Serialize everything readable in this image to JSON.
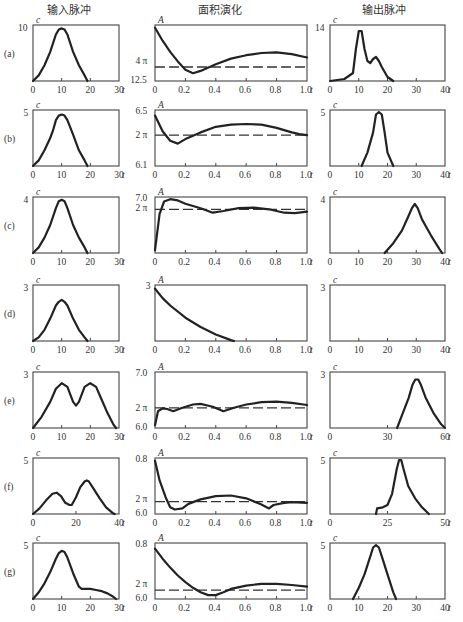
{
  "headers": {
    "input": "输入脉冲",
    "area": "面积演化",
    "output": "输出脉冲"
  },
  "caption": "图 — 对应(a)—(g)的输入脉冲波形、面积演化、输出脉冲波形（示意）",
  "chart_data": [
    {
      "row": "(a)",
      "type": "line",
      "panel": "input",
      "ylabel": "c",
      "xlabel": "t",
      "xlim": [
        0,
        30
      ],
      "ylim": [
        0,
        10
      ],
      "yticks": [
        "10"
      ],
      "xticks": [
        "0",
        "10",
        "20",
        "30"
      ],
      "x": [
        0,
        2,
        4,
        6,
        8,
        9,
        10,
        11,
        12,
        14,
        16,
        18,
        19
      ],
      "y": [
        0,
        1,
        2.8,
        5.2,
        8.3,
        9.2,
        9.4,
        9.2,
        8.3,
        5.2,
        2.8,
        1,
        0
      ]
    },
    {
      "row": "(a)",
      "type": "line",
      "panel": "area",
      "ylabel": "A",
      "xlabel": "t",
      "xlim": [
        0,
        1.0
      ],
      "ylim": [
        12.5,
        "top"
      ],
      "yticks": [
        "4 π",
        "12.5"
      ],
      "xticks": [
        "0",
        "0.2",
        "0.4",
        "0.6",
        "0.8",
        "1.0"
      ],
      "x": [
        0,
        0.05,
        0.1,
        0.15,
        0.2,
        0.25,
        0.3,
        0.4,
        0.5,
        0.6,
        0.7,
        0.8,
        0.9,
        1.0
      ],
      "y": [
        0.95,
        0.72,
        0.52,
        0.35,
        0.2,
        0.14,
        0.18,
        0.3,
        0.4,
        0.46,
        0.5,
        0.51,
        0.48,
        0.42
      ],
      "reference": "4π dashed"
    },
    {
      "row": "(a)",
      "type": "line",
      "panel": "output",
      "ylabel": "c",
      "xlabel": "t",
      "xlim": [
        0,
        40
      ],
      "ylim": [
        0,
        14
      ],
      "yticks": [
        "14"
      ],
      "xticks": [
        "0",
        "10",
        "20",
        "30",
        "40"
      ],
      "x": [
        0,
        5,
        8,
        9,
        10,
        11,
        12,
        13,
        14,
        15,
        16,
        17,
        18,
        20,
        22
      ],
      "y": [
        0,
        0.5,
        2,
        8,
        12.5,
        12.5,
        8,
        5,
        4.5,
        5.5,
        6,
        5,
        3.5,
        1,
        0
      ]
    },
    {
      "row": "(b)",
      "type": "line",
      "panel": "input",
      "ylabel": "c",
      "xlabel": "t",
      "xlim": [
        0,
        30
      ],
      "ylim": [
        0,
        5
      ],
      "yticks": [
        "5"
      ],
      "xticks": [
        "0",
        "10",
        "20",
        "30"
      ],
      "x": [
        0,
        2,
        4,
        6,
        7,
        8,
        9,
        10,
        11,
        12,
        14,
        16,
        18,
        19
      ],
      "y": [
        0,
        0.5,
        1.4,
        2.5,
        3.2,
        4.1,
        4.5,
        4.6,
        4.5,
        4.1,
        2.8,
        1.4,
        0.5,
        0
      ]
    },
    {
      "row": "(b)",
      "type": "line",
      "panel": "area",
      "ylabel": "A",
      "xlabel": "t",
      "xlim": [
        0,
        1.0
      ],
      "ylim": [
        6.1,
        6.5
      ],
      "yticks": [
        "6.5",
        "2 π",
        "6.1"
      ],
      "xticks": [
        "0",
        "0.2",
        "0.4",
        "0.6",
        "0.8",
        "1.0"
      ],
      "x": [
        0,
        0.05,
        0.1,
        0.15,
        0.2,
        0.3,
        0.4,
        0.5,
        0.6,
        0.7,
        0.8,
        0.9,
        0.95,
        1.0
      ],
      "y": [
        0.9,
        0.62,
        0.45,
        0.4,
        0.48,
        0.6,
        0.7,
        0.74,
        0.75,
        0.74,
        0.68,
        0.6,
        0.57,
        0.55
      ],
      "reference": "2π dashed"
    },
    {
      "row": "(b)",
      "type": "line",
      "panel": "output",
      "ylabel": "c",
      "xlabel": "t",
      "xlim": [
        0,
        40
      ],
      "ylim": [
        0,
        5
      ],
      "yticks": [
        "5"
      ],
      "xticks": [
        "0",
        "10",
        "20",
        "30",
        "40"
      ],
      "x": [
        11,
        13,
        15,
        16,
        17,
        18,
        19,
        20,
        22
      ],
      "y": [
        0,
        1.2,
        3,
        4.6,
        4.8,
        4.6,
        3,
        1.2,
        0
      ]
    },
    {
      "row": "(c)",
      "type": "line",
      "panel": "input",
      "ylabel": "c",
      "xlabel": "t",
      "xlim": [
        0,
        30
      ],
      "ylim": [
        0,
        4
      ],
      "yticks": [
        "4"
      ],
      "xticks": [
        "0",
        "10",
        "20",
        "30"
      ],
      "x": [
        0,
        2,
        4,
        6,
        8,
        9,
        10,
        11,
        12,
        14,
        16,
        18,
        19
      ],
      "y": [
        0,
        0.4,
        1.1,
        2,
        3.2,
        3.7,
        3.8,
        3.7,
        3.2,
        2,
        1.1,
        0.4,
        0
      ]
    },
    {
      "row": "(c)",
      "type": "line",
      "panel": "area",
      "ylabel": "A",
      "xlabel": "t",
      "xlim": [
        0,
        1.0
      ],
      "ylim": [
        "bottom",
        7.0
      ],
      "yticks": [
        "7.0",
        "2 π"
      ],
      "xticks": [
        "0",
        "0.2",
        "0.4",
        "0.6",
        "0.8",
        "1.0"
      ],
      "x": [
        0,
        0.03,
        0.06,
        0.1,
        0.15,
        0.2,
        0.3,
        0.38,
        0.45,
        0.55,
        0.65,
        0.75,
        0.85,
        0.92,
        1.0
      ],
      "y": [
        0.05,
        0.7,
        0.92,
        0.96,
        0.94,
        0.88,
        0.8,
        0.72,
        0.75,
        0.8,
        0.81,
        0.78,
        0.72,
        0.71,
        0.74
      ],
      "reference": "2π dashed"
    },
    {
      "row": "(c)",
      "type": "line",
      "panel": "output",
      "ylabel": "c",
      "xlabel": "t",
      "xlim": [
        0,
        40
      ],
      "ylim": [
        0,
        4
      ],
      "yticks": [
        "4"
      ],
      "xticks": [
        "0",
        "10",
        "20",
        "30",
        "40"
      ],
      "x": [
        19,
        22,
        25,
        27,
        28.5,
        29.5,
        30.5,
        32,
        35,
        38,
        39
      ],
      "y": [
        0,
        0.7,
        1.6,
        2.5,
        3.2,
        3.5,
        3.2,
        2.4,
        1.3,
        0.3,
        0
      ]
    },
    {
      "row": "(d)",
      "type": "line",
      "panel": "input",
      "ylabel": "c",
      "xlabel": "t",
      "xlim": [
        0,
        30
      ],
      "ylim": [
        0,
        3
      ],
      "yticks": [
        "3"
      ],
      "xticks": [
        "0",
        "10",
        "20",
        "30"
      ],
      "x": [
        0,
        2,
        4,
        6,
        8,
        9,
        10,
        11,
        12,
        14,
        16,
        18,
        19
      ],
      "y": [
        0,
        0.2,
        0.6,
        1.2,
        1.9,
        2.1,
        2.2,
        2.1,
        1.9,
        1.2,
        0.6,
        0.2,
        0
      ]
    },
    {
      "row": "(d)",
      "type": "line",
      "panel": "area",
      "ylabel": "A",
      "xlabel": "t",
      "xlim": [
        0,
        1.0
      ],
      "ylim": [
        0,
        3
      ],
      "yticks": [
        "3"
      ],
      "xticks": [
        "0",
        "0.2",
        "0.4",
        "0.6",
        "0.8",
        "1.0"
      ],
      "x": [
        0,
        0.05,
        0.1,
        0.2,
        0.3,
        0.4,
        0.5,
        0.52
      ],
      "y": [
        2.8,
        2.3,
        1.9,
        1.25,
        0.75,
        0.35,
        0.05,
        0
      ]
    },
    {
      "row": "(d)",
      "type": "line",
      "panel": "output",
      "ylabel": "c",
      "xlabel": "t",
      "xlim": [
        0,
        40
      ],
      "ylim": [
        0,
        3
      ],
      "yticks": [
        "3"
      ],
      "xticks": [
        "0",
        "10",
        "20",
        "30",
        "40"
      ],
      "x": [],
      "y": []
    },
    {
      "row": "(e)",
      "type": "line",
      "panel": "input",
      "ylabel": "c",
      "xlabel": "t",
      "xlim": [
        0,
        30
      ],
      "ylim": [
        0,
        3
      ],
      "yticks": [
        "3"
      ],
      "xticks": [
        "0",
        "10",
        "20",
        "30"
      ],
      "x": [
        0,
        3,
        6,
        8,
        10,
        12,
        14,
        15,
        16,
        18,
        20,
        22,
        24,
        26,
        28,
        29
      ],
      "y": [
        0,
        0.6,
        1.4,
        2.1,
        2.4,
        2.2,
        1.4,
        1.2,
        1.4,
        2.2,
        2.4,
        2.2,
        1.5,
        0.8,
        0.2,
        0
      ]
    },
    {
      "row": "(e)",
      "type": "line",
      "panel": "area",
      "ylabel": "A",
      "xlabel": "t",
      "xlim": [
        0,
        1.0
      ],
      "ylim": [
        6.0,
        7.0
      ],
      "yticks": [
        "7.0",
        "2 π",
        "6.0"
      ],
      "xticks": [
        "0",
        "0.2",
        "0.4",
        "0.6",
        "0.8",
        "1.0"
      ],
      "x": [
        0,
        0.02,
        0.05,
        0.08,
        0.12,
        0.18,
        0.25,
        0.3,
        0.38,
        0.45,
        0.52,
        0.6,
        0.7,
        0.8,
        0.9,
        1.0
      ],
      "y": [
        0.05,
        0.3,
        0.35,
        0.34,
        0.3,
        0.36,
        0.42,
        0.43,
        0.38,
        0.3,
        0.36,
        0.42,
        0.46,
        0.47,
        0.45,
        0.41
      ],
      "reference": "2π dashed"
    },
    {
      "row": "(e)",
      "type": "line",
      "panel": "output",
      "ylabel": "c",
      "xlabel": "t",
      "xlim": [
        0,
        60
      ],
      "ylim": [
        0,
        3
      ],
      "yticks": [
        "3"
      ],
      "xticks": [
        "0",
        "30",
        "60"
      ],
      "x": [
        35,
        38,
        41,
        43,
        44.5,
        46,
        47.5,
        50,
        54,
        58,
        60
      ],
      "y": [
        0,
        0.8,
        1.6,
        2.3,
        2.6,
        2.6,
        2.3,
        1.6,
        0.8,
        0.2,
        0
      ]
    },
    {
      "row": "(f)",
      "type": "line",
      "panel": "input",
      "ylabel": "c",
      "xlabel": "t",
      "xlim": [
        0,
        40
      ],
      "ylim": [
        0,
        5
      ],
      "yticks": [
        "5"
      ],
      "xticks": [
        "0",
        "20",
        "40"
      ],
      "x": [
        0,
        3,
        6,
        9,
        11,
        13,
        15,
        17,
        18,
        20,
        22,
        24,
        25,
        26,
        28,
        31,
        34,
        37,
        38
      ],
      "y": [
        0,
        0.5,
        1.2,
        1.8,
        1.9,
        1.6,
        1.0,
        0.8,
        0.8,
        1.5,
        2.4,
        2.9,
        3.0,
        2.9,
        2.3,
        1.4,
        0.6,
        0.1,
        0
      ]
    },
    {
      "row": "(f)",
      "type": "line",
      "panel": "area",
      "ylabel": "A",
      "xlabel": "t",
      "xlim": [
        0,
        1.0
      ],
      "ylim": [
        6.0,
        6.8
      ],
      "yticks": [
        "0.8",
        "2 π",
        "6.0"
      ],
      "xticks": [
        "0",
        "0.2",
        "0.4",
        "0.6",
        "0.8",
        "1.0"
      ],
      "x": [
        0,
        0.03,
        0.07,
        0.1,
        0.13,
        0.18,
        0.22,
        0.3,
        0.4,
        0.5,
        0.6,
        0.7,
        0.75,
        0.78,
        0.85,
        0.9,
        1.0
      ],
      "y": [
        0.95,
        0.6,
        0.3,
        0.12,
        0.08,
        0.1,
        0.18,
        0.26,
        0.32,
        0.33,
        0.28,
        0.17,
        0.1,
        0.16,
        0.2,
        0.21,
        0.2
      ],
      "reference": "2π dashed"
    },
    {
      "row": "(f)",
      "type": "line",
      "panel": "output",
      "ylabel": "c",
      "xlabel": "t",
      "xlim": [
        0,
        50
      ],
      "ylim": [
        0,
        5
      ],
      "yticks": [
        "5"
      ],
      "xticks": [
        "0",
        "25",
        "50"
      ],
      "x": [
        20,
        20.5,
        23,
        25,
        27,
        29,
        30,
        31,
        32,
        34,
        37,
        40,
        43
      ],
      "y": [
        0,
        0.5,
        0.6,
        0.8,
        1.8,
        4,
        4.8,
        4.8,
        4,
        2.5,
        1.4,
        0.6,
        0
      ]
    },
    {
      "row": "(g)",
      "type": "line",
      "panel": "input",
      "ylabel": "c",
      "xlabel": "t",
      "xlim": [
        0,
        30
      ],
      "ylim": [
        0,
        5
      ],
      "yticks": [
        "5"
      ],
      "xticks": [
        "0",
        "10",
        "20",
        "30"
      ],
      "x": [
        0,
        2,
        4,
        6,
        8,
        9,
        10,
        11,
        12,
        14,
        16,
        17,
        18,
        20,
        22,
        24,
        26,
        28,
        29
      ],
      "y": [
        0,
        0.6,
        1.4,
        2.4,
        3.6,
        4.1,
        4.3,
        4.2,
        3.7,
        2.3,
        1.1,
        0.9,
        0.9,
        0.9,
        0.8,
        0.7,
        0.5,
        0.2,
        0
      ]
    },
    {
      "row": "(g)",
      "type": "line",
      "panel": "area",
      "ylabel": "A",
      "xlabel": "t",
      "xlim": [
        0,
        1.0
      ],
      "ylim": [
        6.0,
        6.8
      ],
      "yticks": [
        "0.8",
        "2 π",
        "6.0"
      ],
      "xticks": [
        "0",
        "0.2",
        "0.4",
        "0.6",
        "0.8",
        "1.0"
      ],
      "x": [
        0,
        0.05,
        0.1,
        0.15,
        0.2,
        0.25,
        0.3,
        0.35,
        0.4,
        0.45,
        0.5,
        0.6,
        0.7,
        0.8,
        0.9,
        1.0
      ],
      "y": [
        0.9,
        0.72,
        0.56,
        0.42,
        0.3,
        0.2,
        0.12,
        0.07,
        0.07,
        0.12,
        0.18,
        0.24,
        0.27,
        0.27,
        0.25,
        0.22
      ],
      "reference": "2π dashed"
    },
    {
      "row": "(g)",
      "type": "line",
      "panel": "output",
      "ylabel": "c",
      "xlabel": "t",
      "xlim": [
        0,
        40
      ],
      "ylim": [
        0,
        5
      ],
      "yticks": [
        "5"
      ],
      "xticks": [
        "0",
        "10",
        "20",
        "30",
        "40"
      ],
      "x": [
        8,
        10,
        12,
        14,
        15,
        16,
        17,
        18,
        20,
        22,
        23
      ],
      "y": [
        0,
        1,
        2.2,
        3.8,
        4.6,
        4.8,
        4.6,
        3.8,
        2.2,
        0.6,
        0
      ]
    }
  ]
}
